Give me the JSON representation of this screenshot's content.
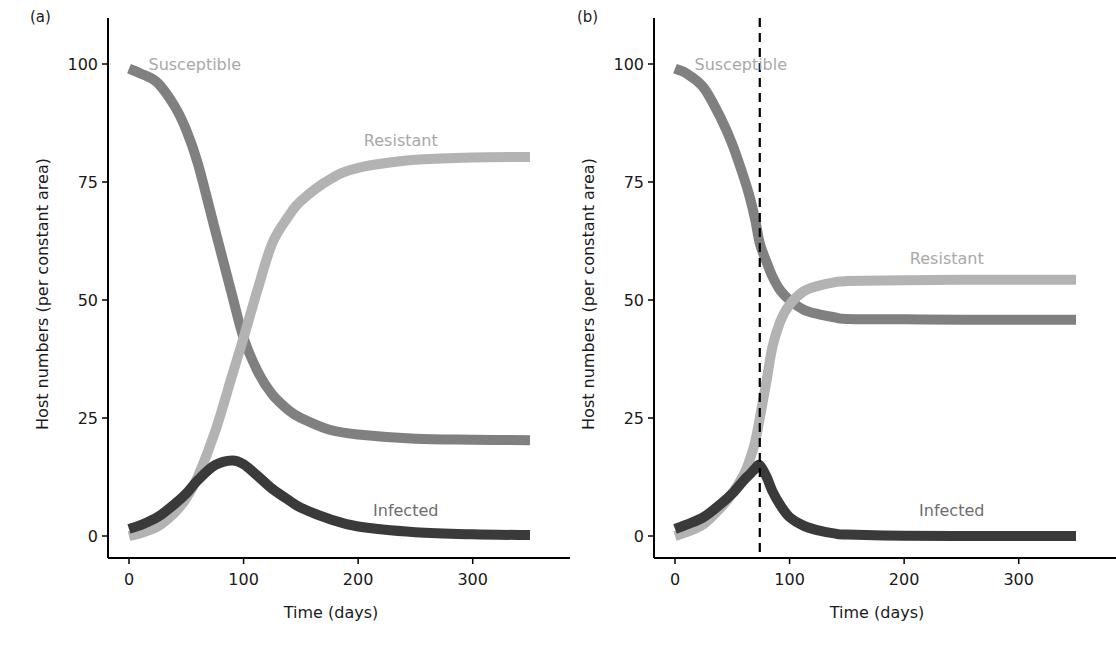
{
  "figure": {
    "panels": [
      {
        "id": "a",
        "label": "(a)"
      },
      {
        "id": "b",
        "label": "(b)"
      }
    ]
  },
  "colors": {
    "susceptible": "#808080",
    "resistant": "#b3b3b3",
    "infected": "#3a3a3a",
    "axis": "#000000",
    "label_text": "#a8a8a8",
    "infected_label_text": "#6e6e6e"
  },
  "chart_data": [
    {
      "type": "line",
      "panel": "(a)",
      "title": "",
      "xlabel": "Time (days)",
      "ylabel": "Host numbers (per constant area)",
      "xlim": [
        0,
        350
      ],
      "ylim": [
        -5,
        103
      ],
      "xticks": [
        0,
        100,
        200,
        300
      ],
      "yticks": [
        0,
        25,
        50,
        75,
        100
      ],
      "grid": false,
      "legend": "inline labels",
      "series": [
        {
          "name": "Susceptible",
          "color": "#808080",
          "label_pos": [
            17,
            100
          ],
          "x": [
            0,
            10,
            25,
            40,
            50,
            60,
            75,
            90,
            100,
            112,
            125,
            140,
            150,
            175,
            200,
            250,
            300,
            350
          ],
          "y": [
            99,
            98,
            96,
            91,
            86,
            79,
            65,
            51,
            42,
            35,
            30,
            26.5,
            25,
            22.5,
            21.5,
            20.6,
            20.4,
            20.3
          ]
        },
        {
          "name": "Resistant",
          "color": "#b3b3b3",
          "label_pos": [
            205,
            84
          ],
          "x": [
            0,
            10,
            25,
            40,
            50,
            60,
            75,
            90,
            100,
            112,
            125,
            140,
            150,
            175,
            200,
            250,
            300,
            350
          ],
          "y": [
            0,
            0.6,
            2,
            5,
            8,
            12.5,
            22,
            34,
            42,
            52,
            62,
            68,
            71,
            75.5,
            78,
            79.7,
            80.2,
            80.3
          ]
        },
        {
          "name": "Infected",
          "color": "#3a3a3a",
          "label_pos": [
            213,
            5.5
          ],
          "x": [
            0,
            10,
            25,
            40,
            50,
            60,
            75,
            90,
            100,
            112,
            125,
            140,
            150,
            175,
            200,
            250,
            300,
            350
          ],
          "y": [
            1.5,
            2.3,
            4,
            6.8,
            9,
            11.8,
            15,
            16,
            15.2,
            12.8,
            10,
            7.5,
            6,
            3.6,
            2,
            0.8,
            0.35,
            0.2
          ]
        }
      ]
    },
    {
      "type": "line",
      "panel": "(b)",
      "title": "",
      "xlabel": "Time (days)",
      "ylabel": "Host numbers (per constant area)",
      "xlim": [
        0,
        350
      ],
      "ylim": [
        -5,
        103
      ],
      "xticks": [
        0,
        100,
        200,
        300
      ],
      "yticks": [
        0,
        25,
        50,
        75,
        100
      ],
      "grid": false,
      "legend": "inline labels",
      "annotations": [
        {
          "type": "vline",
          "x": 74,
          "style": "dashed",
          "color": "#000000"
        }
      ],
      "series": [
        {
          "name": "Susceptible",
          "color": "#808080",
          "label_pos": [
            17,
            100
          ],
          "x": [
            0,
            10,
            25,
            40,
            50,
            60,
            65,
            70,
            74,
            80,
            85,
            92,
            100,
            112,
            125,
            140,
            150,
            200,
            250,
            300,
            350
          ],
          "y": [
            99,
            98,
            95,
            88.5,
            83,
            76,
            72,
            67,
            62,
            58,
            55,
            52,
            50,
            48,
            47,
            46.3,
            46,
            45.9,
            45.8,
            45.8,
            45.8
          ]
        },
        {
          "name": "Resistant",
          "color": "#b3b3b3",
          "label_pos": [
            205,
            59
          ],
          "x": [
            0,
            10,
            25,
            40,
            50,
            60,
            65,
            70,
            74,
            80,
            85,
            92,
            100,
            112,
            125,
            140,
            150,
            200,
            250,
            300,
            350
          ],
          "y": [
            0,
            0.8,
            2.5,
            6,
            9,
            13,
            16,
            20,
            25,
            33,
            40,
            45.5,
            49,
            51.8,
            53,
            53.8,
            54,
            54.2,
            54.3,
            54.3,
            54.3
          ]
        },
        {
          "name": "Infected",
          "color": "#3a3a3a",
          "label_pos": [
            213,
            5.5
          ],
          "x": [
            0,
            10,
            25,
            40,
            50,
            60,
            65,
            70,
            74,
            80,
            85,
            92,
            100,
            112,
            125,
            140,
            150,
            200,
            250,
            300,
            350
          ],
          "y": [
            1.5,
            2.4,
            4,
            6.8,
            9,
            11.8,
            13,
            14.3,
            15,
            12.5,
            9.5,
            6.5,
            4,
            2.2,
            1.2,
            0.5,
            0.3,
            0.05,
            0,
            0,
            0
          ]
        }
      ]
    }
  ]
}
